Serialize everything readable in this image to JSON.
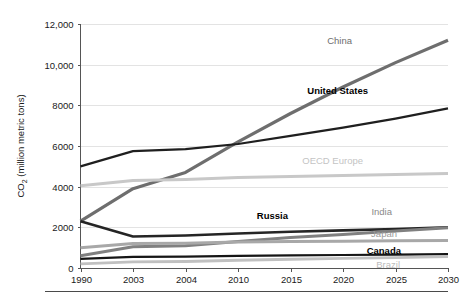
{
  "chart_data": {
    "type": "line",
    "title": "",
    "subtitle": "",
    "xlabel": "",
    "ylabel": "CO2 (million metric tons)",
    "ylabel_main": "CO",
    "ylabel_sub": "2",
    "ylabel_rest": " (million metric tons)",
    "categories": [
      "1990",
      "2003",
      "2004",
      "2010",
      "2015",
      "2020",
      "2025",
      "2030"
    ],
    "ylim": [
      0,
      12000
    ],
    "yticks": [
      0,
      2000,
      4000,
      6000,
      8000,
      10000,
      12000
    ],
    "ytick_labels": [
      "0",
      "2000",
      "4000",
      "6000",
      "8000",
      "10,000",
      "12,000"
    ],
    "grid": true,
    "grid_axis": "y",
    "legend": "inline-series-labels",
    "legend_position": "right-of-line-ends",
    "series": [
      {
        "name": "China",
        "color": "#6e6e6e",
        "label_color": "#6e6e6e",
        "label_bold": false,
        "stroke_width": 3.2,
        "values": [
          2300,
          3900,
          4700,
          6200,
          7600,
          8900,
          10100,
          11200
        ],
        "label_x": 352,
        "label_y": 44
      },
      {
        "name": "United States",
        "color": "#1f1f1f",
        "label_color": "#000000",
        "label_bold": true,
        "stroke_width": 2.2,
        "values": [
          5000,
          5750,
          5850,
          6100,
          6500,
          6900,
          7350,
          7850
        ],
        "label_x": 368,
        "label_y": 94
      },
      {
        "name": "OECD Europe",
        "color": "#c8c8c8",
        "label_color": "#c4c4c4",
        "label_bold": false,
        "stroke_width": 3.0,
        "values": [
          4050,
          4300,
          4350,
          4450,
          4500,
          4550,
          4600,
          4650
        ],
        "label_x": 363,
        "label_y": 164
      },
      {
        "name": "Russia",
        "color": "#252525",
        "label_color": "#000000",
        "label_bold": true,
        "stroke_width": 2.6,
        "values": [
          2300,
          1550,
          1600,
          1700,
          1780,
          1850,
          1920,
          2000
        ],
        "label_x": 288,
        "label_y": 219
      },
      {
        "name": "India",
        "color": "#808080",
        "label_color": "#8a8a8a",
        "label_bold": false,
        "stroke_width": 3.0,
        "values": [
          600,
          1050,
          1100,
          1300,
          1500,
          1650,
          1820,
          1980
        ],
        "label_x": 392,
        "label_y": 215
      },
      {
        "name": "Japan",
        "color": "#a8a8a8",
        "label_color": "#9a9a9a",
        "label_bold": false,
        "stroke_width": 3.0,
        "values": [
          1000,
          1200,
          1220,
          1280,
          1300,
          1320,
          1340,
          1350
        ],
        "label_x": 397,
        "label_y": 237
      },
      {
        "name": "Canada",
        "color": "#151515",
        "label_color": "#000000",
        "label_bold": true,
        "stroke_width": 2.2,
        "values": [
          450,
          550,
          560,
          600,
          620,
          640,
          660,
          680
        ],
        "label_x": 401,
        "label_y": 254
      },
      {
        "name": "Brazil",
        "color": "#c0c0c0",
        "label_color": "#bcbcbc",
        "label_bold": false,
        "stroke_width": 2.8,
        "values": [
          200,
          300,
          320,
          380,
          430,
          470,
          510,
          560
        ],
        "label_x": 400,
        "label_y": 268
      }
    ]
  },
  "colors": {
    "background": "#ffffff",
    "gridline": "#dcdcdc",
    "axis": "#555555",
    "text": "#1a1a1a",
    "footer_rule": "#4a4a4a"
  }
}
